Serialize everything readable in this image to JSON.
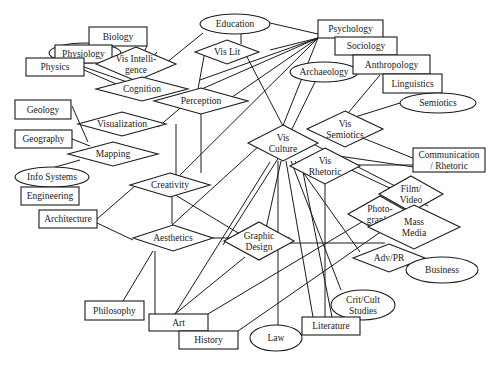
{
  "diagram": {
    "legend_shapes": {
      "rectangle": "discipline",
      "ellipse": "field",
      "diamond": "visual concept"
    },
    "nodes": [
      {
        "id": "neuroscience",
        "label": [
          "Neuroscience"
        ],
        "shape": "ellipse",
        "x": 49,
        "y": 43,
        "w": 72,
        "h": 20
      },
      {
        "id": "biology",
        "label": [
          "Biology"
        ],
        "shape": "rect",
        "x": 89,
        "y": 27,
        "w": 58,
        "h": 19
      },
      {
        "id": "physiology",
        "label": [
          "Physiology"
        ],
        "shape": "rect",
        "x": 55,
        "y": 45,
        "w": 57,
        "h": 18
      },
      {
        "id": "physics",
        "label": [
          "Physics"
        ],
        "shape": "rect",
        "x": 26,
        "y": 58,
        "w": 58,
        "h": 18
      },
      {
        "id": "vis_intelligence",
        "label": [
          "Vis  Intelli-",
          "gence"
        ],
        "shape": "diamond",
        "x": 96,
        "y": 47,
        "w": 80,
        "h": 34
      },
      {
        "id": "cognition",
        "label": [
          "Cognition"
        ],
        "shape": "diamond",
        "x": 96,
        "y": 77,
        "w": 92,
        "h": 24
      },
      {
        "id": "education",
        "label": [
          "Education"
        ],
        "shape": "ellipse",
        "x": 200,
        "y": 14,
        "w": 70,
        "h": 20
      },
      {
        "id": "vis_lit",
        "label": [
          "Vis Lit"
        ],
        "shape": "diamond",
        "x": 195,
        "y": 40,
        "w": 64,
        "h": 24
      },
      {
        "id": "perception",
        "label": [
          "Perception"
        ],
        "shape": "diamond",
        "x": 154,
        "y": 88,
        "w": 94,
        "h": 26
      },
      {
        "id": "psychology",
        "label": [
          "Psychology"
        ],
        "shape": "rect",
        "x": 318,
        "y": 20,
        "w": 65,
        "h": 18
      },
      {
        "id": "sociology",
        "label": [
          "Sociology"
        ],
        "shape": "rect",
        "x": 335,
        "y": 37,
        "w": 62,
        "h": 18
      },
      {
        "id": "archaeology",
        "label": [
          "Archaeology"
        ],
        "shape": "ellipse",
        "x": 290,
        "y": 62,
        "w": 68,
        "h": 20
      },
      {
        "id": "anthropology",
        "label": [
          "Anthropology"
        ],
        "shape": "rect",
        "x": 353,
        "y": 55,
        "w": 77,
        "h": 19
      },
      {
        "id": "linguistics",
        "label": [
          "Linguistics"
        ],
        "shape": "rect",
        "x": 383,
        "y": 74,
        "w": 59,
        "h": 19
      },
      {
        "id": "semiotics",
        "label": [
          "Semiotics"
        ],
        "shape": "ellipse",
        "x": 400,
        "y": 93,
        "w": 76,
        "h": 20
      },
      {
        "id": "geology",
        "label": [
          "Geology"
        ],
        "shape": "rect",
        "x": 15,
        "y": 100,
        "w": 56,
        "h": 19
      },
      {
        "id": "visualization",
        "label": [
          "Visualization"
        ],
        "shape": "diamond",
        "x": 78,
        "y": 112,
        "w": 88,
        "h": 24
      },
      {
        "id": "geography",
        "label": [
          "Geography"
        ],
        "shape": "rect",
        "x": 15,
        "y": 130,
        "w": 57,
        "h": 18
      },
      {
        "id": "mapping",
        "label": [
          "Mapping"
        ],
        "shape": "diamond",
        "x": 68,
        "y": 142,
        "w": 90,
        "h": 24
      },
      {
        "id": "info_systems",
        "label": [
          "Info Systems"
        ],
        "shape": "ellipse",
        "x": 15,
        "y": 167,
        "w": 74,
        "h": 20
      },
      {
        "id": "engineering",
        "label": [
          "Engineering"
        ],
        "shape": "rect",
        "x": 21,
        "y": 187,
        "w": 58,
        "h": 18
      },
      {
        "id": "vis_culture",
        "label": [
          "Vis",
          "Culture"
        ],
        "shape": "diamond",
        "x": 248,
        "y": 125,
        "w": 70,
        "h": 36
      },
      {
        "id": "vis_semiotics",
        "label": [
          "Vis",
          "Semiotics"
        ],
        "shape": "diamond",
        "x": 307,
        "y": 111,
        "w": 76,
        "h": 36
      },
      {
        "id": "vis_rhetoric",
        "label": [
          "Vis",
          "Rhetoric"
        ],
        "shape": "diamond",
        "x": 290,
        "y": 148,
        "w": 70,
        "h": 36
      },
      {
        "id": "communication_rhetoric",
        "label": [
          "Communication",
          "/ Rhetoric"
        ],
        "shape": "rect",
        "x": 413,
        "y": 148,
        "w": 72,
        "h": 24
      },
      {
        "id": "creativity",
        "label": [
          "Creativity"
        ],
        "shape": "diamond",
        "x": 130,
        "y": 173,
        "w": 80,
        "h": 24
      },
      {
        "id": "architecture",
        "label": [
          "Architecture"
        ],
        "shape": "rect",
        "x": 39,
        "y": 210,
        "w": 58,
        "h": 18
      },
      {
        "id": "film_video",
        "label": [
          "Film/",
          "Video"
        ],
        "shape": "diamond",
        "x": 379,
        "y": 176,
        "w": 64,
        "h": 36
      },
      {
        "id": "photography",
        "label": [
          "Photo-",
          "graphy"
        ],
        "shape": "diamond",
        "x": 348,
        "y": 196,
        "w": 64,
        "h": 36
      },
      {
        "id": "mass_media",
        "label": [
          "Mass",
          "Media"
        ],
        "shape": "diamond",
        "x": 368,
        "y": 205,
        "w": 92,
        "h": 44
      },
      {
        "id": "aesthetics",
        "label": [
          "Aesthetics"
        ],
        "shape": "diamond",
        "x": 133,
        "y": 225,
        "w": 80,
        "h": 26
      },
      {
        "id": "graphic_design",
        "label": [
          "Graphic",
          "Design"
        ],
        "shape": "diamond",
        "x": 224,
        "y": 222,
        "w": 70,
        "h": 38
      },
      {
        "id": "adv_pr",
        "label": [
          "Adv/PR"
        ],
        "shape": "diamond",
        "x": 353,
        "y": 244,
        "w": 72,
        "h": 28
      },
      {
        "id": "business",
        "label": [
          "Business"
        ],
        "shape": "ellipse",
        "x": 406,
        "y": 257,
        "w": 72,
        "h": 26
      },
      {
        "id": "philosophy",
        "label": [
          "Philosophy"
        ],
        "shape": "rect",
        "x": 85,
        "y": 301,
        "w": 59,
        "h": 19
      },
      {
        "id": "crit_cult_studies",
        "label": [
          "Crit/Cult",
          "Studies"
        ],
        "shape": "ellipse",
        "x": 331,
        "y": 290,
        "w": 64,
        "h": 30
      },
      {
        "id": "art",
        "label": [
          "Art"
        ],
        "shape": "rect",
        "x": 149,
        "y": 314,
        "w": 59,
        "h": 17
      },
      {
        "id": "history",
        "label": [
          "History"
        ],
        "shape": "rect",
        "x": 179,
        "y": 331,
        "w": 59,
        "h": 18
      },
      {
        "id": "law",
        "label": [
          "Law"
        ],
        "shape": "ellipse",
        "x": 250,
        "y": 325,
        "w": 52,
        "h": 26
      },
      {
        "id": "literature",
        "label": [
          "Literature"
        ],
        "shape": "rect",
        "x": 302,
        "y": 317,
        "w": 58,
        "h": 18
      }
    ],
    "edges": [
      [
        112,
        57,
        142,
        80
      ],
      [
        147,
        46,
        142,
        56
      ],
      [
        84,
        67,
        150,
        90
      ],
      [
        84,
        70,
        130,
        90
      ],
      [
        134,
        81,
        157,
        52
      ],
      [
        203,
        33,
        155,
        72
      ],
      [
        270,
        23,
        318,
        34
      ],
      [
        241,
        34,
        241,
        44
      ],
      [
        318,
        38,
        270,
        50
      ],
      [
        318,
        38,
        200,
        80
      ],
      [
        318,
        38,
        188,
        95
      ],
      [
        318,
        38,
        222,
        104
      ],
      [
        318,
        38,
        280,
        133
      ],
      [
        318,
        38,
        169,
        186
      ],
      [
        205,
        51,
        198,
        89
      ],
      [
        247,
        57,
        283,
        126
      ],
      [
        316,
        80,
        290,
        133
      ],
      [
        380,
        75,
        338,
        125
      ],
      [
        400,
        103,
        352,
        118
      ],
      [
        360,
        137,
        448,
        172
      ],
      [
        318,
        153,
        448,
        172
      ],
      [
        340,
        165,
        413,
        165
      ],
      [
        315,
        145,
        399,
        188
      ],
      [
        330,
        160,
        428,
        206
      ],
      [
        72,
        106,
        88,
        142
      ],
      [
        72,
        139,
        90,
        146
      ],
      [
        113,
        124,
        113,
        134
      ],
      [
        80,
        160,
        52,
        168
      ],
      [
        158,
        127,
        185,
        104
      ],
      [
        176,
        124,
        176,
        181
      ],
      [
        201,
        112,
        201,
        173
      ],
      [
        97,
        219,
        135,
        186
      ],
      [
        97,
        223,
        133,
        240
      ],
      [
        172,
        193,
        172,
        224
      ],
      [
        172,
        193,
        258,
        245
      ],
      [
        172,
        225,
        260,
        145
      ],
      [
        153,
        251,
        123,
        301
      ],
      [
        155,
        251,
        155,
        314
      ],
      [
        213,
        238,
        290,
        238
      ],
      [
        223,
        245,
        279,
        157
      ],
      [
        259,
        260,
        281,
        161
      ],
      [
        175,
        314,
        270,
        162
      ],
      [
        175,
        314,
        245,
        257
      ],
      [
        208,
        314,
        375,
        214
      ],
      [
        238,
        331,
        395,
        222
      ],
      [
        270,
        243,
        385,
        243
      ],
      [
        278,
        161,
        278,
        326
      ],
      [
        286,
        161,
        313,
        317
      ],
      [
        291,
        161,
        341,
        290
      ],
      [
        295,
        161,
        360,
        252
      ],
      [
        302,
        167,
        332,
        317
      ],
      [
        325,
        182,
        325,
        317
      ],
      [
        400,
        210,
        400,
        218
      ]
    ]
  }
}
